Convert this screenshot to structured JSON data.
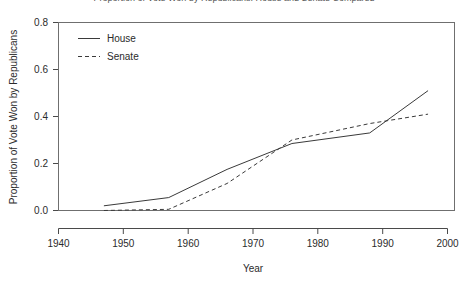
{
  "chart_data": {
    "type": "line",
    "title": "Proportion of Vote Won by Republicans: House and Senate Compared",
    "xlabel": "Year",
    "ylabel": "Proportion of Vote Won by Republicans",
    "xlim": [
      1940,
      2000
    ],
    "ylim": [
      0.0,
      0.8
    ],
    "xticks": [
      1940,
      1950,
      1960,
      1970,
      1980,
      1990,
      2000
    ],
    "xticklabels": [
      "1940",
      "1950",
      "1960",
      "1970",
      "1980",
      "1990",
      "2000"
    ],
    "yticks": [
      0.0,
      0.2,
      0.4,
      0.6,
      0.8
    ],
    "yticklabels": [
      "0.0",
      "0.2",
      "0.4",
      "0.6",
      "0.8"
    ],
    "grid": false,
    "legend_position": "top-left",
    "series": [
      {
        "name": "House",
        "style": "solid",
        "color": "#3a3a3a",
        "x": [
          1947,
          1957,
          1966,
          1976,
          1988,
          1997
        ],
        "values": [
          0.02,
          0.055,
          0.175,
          0.285,
          0.33,
          0.51
        ]
      },
      {
        "name": "Senate",
        "style": "dashed",
        "color": "#3a3a3a",
        "x": [
          1947,
          1957,
          1966,
          1976,
          1988,
          1997
        ],
        "values": [
          0.0,
          0.005,
          0.115,
          0.3,
          0.37,
          0.41
        ]
      }
    ]
  },
  "legend": {
    "items": [
      {
        "label": "House",
        "style": "solid"
      },
      {
        "label": "Senate",
        "style": "dashed"
      }
    ]
  }
}
